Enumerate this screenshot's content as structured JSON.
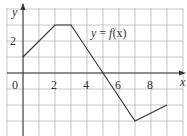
{
  "chart_data": {
    "type": "line",
    "title": "",
    "annotation": "y = f(x)",
    "xlabel": "x",
    "ylabel": "y",
    "x_tick_labels": [
      "0",
      "2",
      "4",
      "6",
      "8"
    ],
    "y_tick_labels": [
      "2"
    ],
    "xlim": [
      -1,
      10
    ],
    "ylim": [
      -4,
      4
    ],
    "grid": true,
    "grid_step": 1,
    "series": [
      {
        "name": "y = f(x)",
        "x": [
          0,
          2,
          3,
          7,
          9
        ],
        "y": [
          1,
          3,
          3,
          -3,
          -2
        ]
      }
    ]
  },
  "labels": {
    "origin": "0",
    "x2": "2",
    "x4": "4",
    "x6": "6",
    "x8": "8",
    "y2": "2",
    "x_axis": "x",
    "y_axis": "y",
    "func_y": "y",
    "func_eq": " = ",
    "func_f": "f",
    "func_arg": "(x)"
  },
  "colors": {
    "grid": "#b8b8b8",
    "axis": "#333333",
    "curve": "#333333"
  }
}
